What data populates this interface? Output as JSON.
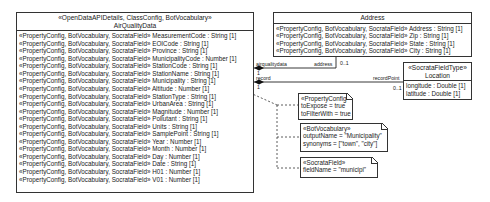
{
  "air_quality_class": {
    "stereotype": "«OpenDataAPIDetails, ClassConfig, BotVocabulary»",
    "name": "AirQualityData",
    "attributes": [
      "«PropertyConfig, BotVocabulary, SocrataField» MeasurementCode : String [1]",
      "«PropertyConfig, BotVocabulary, SocrataField» EOICode : String [1]",
      "«PropertyConfig, BotVocabulary, SocrataField» Province : String [1]",
      "«PropertyConfig, BotVocabulary, SocrataField» MunicipalityCode : Number [1]",
      "«PropertyConfig, BotVocabulary, SocrataField» StationCode : String [1]",
      "«PropertyConfig, BotVocabulary, SocrataField» StationName : String [1]",
      "«PropertyConfig, BotVocabulary, SocrataField» Municipality : String [1]",
      "«PropertyConfig, BotVocabulary, SocrataField» Altitude : Number [1]",
      "«PropertyConfig, BotVocabulary, SocrataField» StationType : String [1]",
      "«PropertyConfig, BotVocabulary, SocrataField» UrbanArea : String [1]",
      "«PropertyConfig, BotVocabulary, SocrataField» Magnitude : Number [1]",
      "«PropertyConfig, BotVocabulary, SocrataField» Pollutant : String [1]",
      "«PropertyConfig, BotVocabulary, SocrataField» Units : String [1]",
      "«PropertyConfig, BotVocabulary, SocrataField» SamplePoint : String [1]",
      "«PropertyConfig, BotVocabulary, SocrataField» Year : Number [1]",
      "«PropertyConfig, BotVocabulary, SocrataField» Month : Number [1]",
      "«PropertyConfig, BotVocabulary, SocrataField» Day : Number [1]",
      "«PropertyConfig, BotVocabulary, SocrataField» Date : String [1]",
      "«PropertyConfig, BotVocabulary, SocrataField» H01 : Number [1]",
      "«PropertyConfig, BotVocabulary, SocrataField» V01 : Number [1]"
    ]
  },
  "address_class": {
    "name": "Address",
    "attributes": [
      "«PropertyConfig, BotVocabulary, SocrataField» Address : String [1]",
      "«PropertyConfig, BotVocabulary, SocrataField» Zip : String [1]",
      "«PropertyConfig, BotVocabulary, SocrataField» State : String [1]",
      "«PropertyConfig, BotVocabulary, SocrataField» City : String [1]"
    ]
  },
  "location_class": {
    "stereotype": "«SocrataFieldType»",
    "name": "Location",
    "attributes": [
      "longitude : Double [1]",
      "latitude : Double [1]"
    ]
  },
  "associations": {
    "address": {
      "source_role": "airqualitydata",
      "source_mult": "1",
      "target_role": "address",
      "target_mult": "0..1"
    },
    "location": {
      "source_role": "record",
      "source_mult": "1",
      "target_role": "recordPoint",
      "target_mult": "0..1"
    }
  },
  "notes": [
    {
      "lines": [
        "«PropertyConfig»",
        "toExpose = true",
        "toFilterWith = true"
      ]
    },
    {
      "lines": [
        "«BotVocabulary»",
        "outputName = \"Municipality\"",
        "synonyms = [\"town\", \"city\"]"
      ]
    },
    {
      "lines": [
        "«SocrataField»",
        "fieldName = \"municipi\""
      ]
    }
  ]
}
